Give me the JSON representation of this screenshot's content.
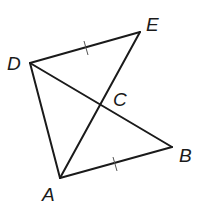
{
  "diagram": {
    "type": "geometry",
    "points": {
      "A": {
        "label": "A",
        "x": 60,
        "y": 178
      },
      "B": {
        "label": "B",
        "x": 172,
        "y": 147
      },
      "C": {
        "label": "C",
        "x": 101,
        "y": 106
      },
      "D": {
        "label": "D",
        "x": 30,
        "y": 63
      },
      "E": {
        "label": "E",
        "x": 140,
        "y": 32
      }
    },
    "segments": [
      {
        "name": "DE",
        "from": "D",
        "to": "E",
        "tick_marks": 1
      },
      {
        "name": "DA",
        "from": "D",
        "to": "A",
        "tick_marks": 0
      },
      {
        "name": "DB",
        "from": "D",
        "to": "B",
        "tick_marks": 0
      },
      {
        "name": "AE",
        "from": "A",
        "to": "E",
        "tick_marks": 0
      },
      {
        "name": "AB",
        "from": "A",
        "to": "B",
        "tick_marks": 1
      }
    ],
    "congruence_marks": [
      "DE ≅ AB"
    ],
    "labels": {
      "A": "A",
      "B": "B",
      "C": "C",
      "D": "D",
      "E": "E"
    },
    "colors": {
      "line": "#1a1a1a",
      "tick": "#555555",
      "background": "#ffffff"
    }
  }
}
